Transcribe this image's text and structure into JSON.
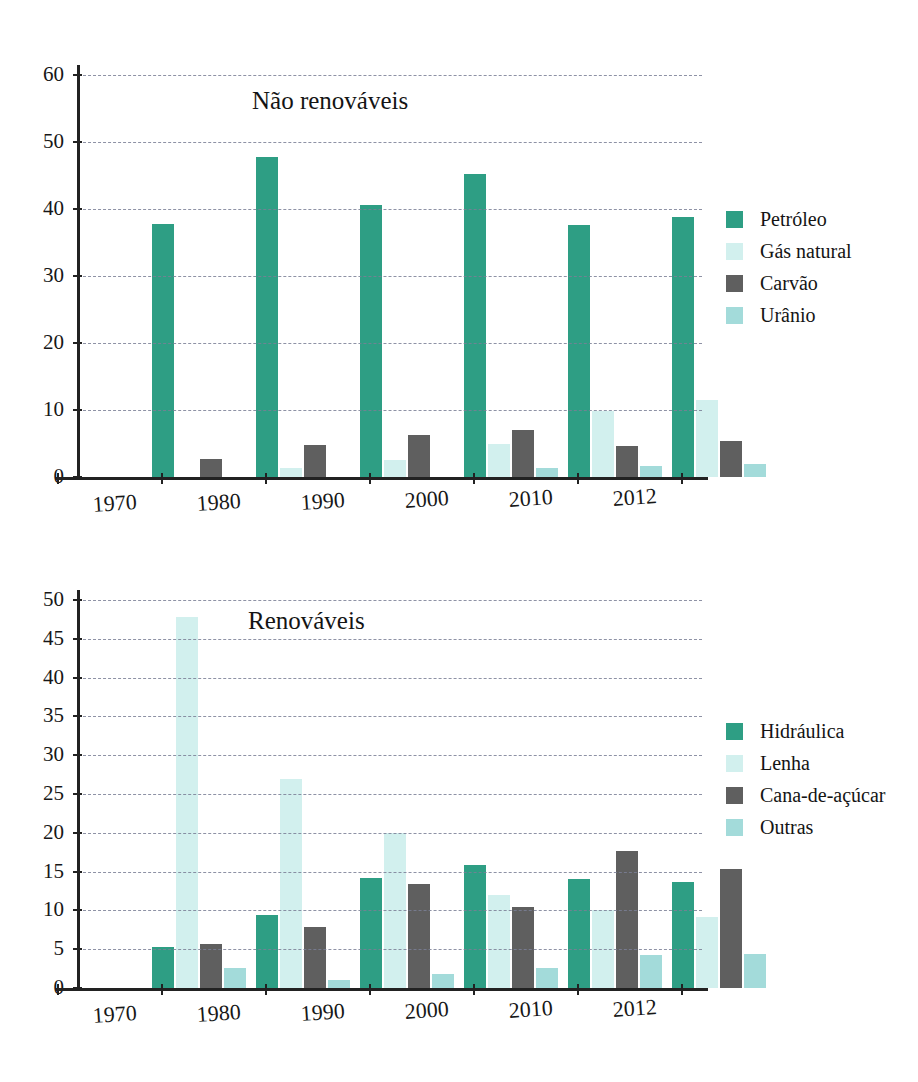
{
  "colors": {
    "series1": "#2e9e84",
    "series2": "#d2f0ee",
    "series3": "#5f5f5f",
    "series4": "#a3dbda",
    "grid": "#7b7f96",
    "axis": "#222222",
    "text": "#141414",
    "background": "#ffffff"
  },
  "chart_data": [
    {
      "id": "nao-renovaveis",
      "type": "bar",
      "title": "Não renováveis",
      "xlabel": "",
      "ylabel": "",
      "ylim": [
        0,
        60
      ],
      "yticks": [
        0,
        10,
        20,
        30,
        40,
        50,
        60
      ],
      "grid": true,
      "legend_position": "right",
      "categories": [
        "1970",
        "1980",
        "1990",
        "2000",
        "2010",
        "2012"
      ],
      "series": [
        {
          "name": "Petróleo",
          "color": "#2e9e84",
          "values": [
            37.7,
            47.8,
            40.6,
            45.3,
            37.6,
            38.8
          ]
        },
        {
          "name": "Gás natural",
          "color": "#d2f0ee",
          "values": [
            0.0,
            1.4,
            2.6,
            5.0,
            9.8,
            11.5
          ]
        },
        {
          "name": "Carvão",
          "color": "#5f5f5f",
          "values": [
            2.7,
            4.8,
            6.3,
            7.0,
            4.6,
            5.4
          ]
        },
        {
          "name": "Urânio",
          "color": "#a3dbda",
          "values": [
            0.0,
            0.0,
            0.0,
            1.3,
            1.7,
            2.0
          ]
        }
      ]
    },
    {
      "id": "renovaveis",
      "type": "bar",
      "title": "Renováveis",
      "xlabel": "",
      "ylabel": "",
      "ylim": [
        0,
        50
      ],
      "yticks": [
        0,
        5,
        10,
        15,
        20,
        25,
        30,
        35,
        40,
        45,
        50
      ],
      "grid": true,
      "legend_position": "right",
      "categories": [
        "1970",
        "1980",
        "1990",
        "2000",
        "2010",
        "2012"
      ],
      "series": [
        {
          "name": "Hidráulica",
          "color": "#2e9e84",
          "values": [
            5.3,
            9.4,
            14.2,
            15.9,
            14.0,
            13.6
          ]
        },
        {
          "name": "Lenha",
          "color": "#d2f0ee",
          "values": [
            47.8,
            26.9,
            20.0,
            12.0,
            10.1,
            9.1
          ]
        },
        {
          "name": "Cana-de-açúcar",
          "color": "#5f5f5f",
          "values": [
            5.7,
            7.9,
            13.4,
            10.4,
            17.6,
            15.4
          ]
        },
        {
          "name": "Outras",
          "color": "#a3dbda",
          "values": [
            2.6,
            1.0,
            1.8,
            2.6,
            4.3,
            4.4
          ]
        }
      ]
    }
  ]
}
